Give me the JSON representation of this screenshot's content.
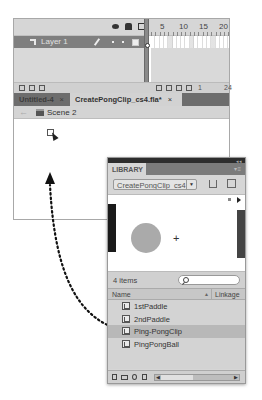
{
  "timeline": {
    "header_icons": [
      "eye-icon",
      "lock-icon",
      "outline-icon"
    ],
    "ruler_marks": [
      "5",
      "10",
      "15",
      "20"
    ],
    "layer": {
      "name": "Layer 1"
    },
    "footer_frame": "1",
    "footer_right": "24"
  },
  "tabs": [
    {
      "label": "Untitled-4",
      "close": "×",
      "active": false
    },
    {
      "label": "CreatePongClip_cs4.fla*",
      "close": "×",
      "active": true
    }
  ],
  "edit_bar": {
    "back": "←",
    "scene": "Scene 2"
  },
  "library": {
    "title": "LIBRARY",
    "menu": "▾≡",
    "document": "CreatePongClip_cs4",
    "item_count": "4 items",
    "search_placeholder": "",
    "columns": {
      "name": "Name",
      "sort": "▲",
      "linkage": "Linkage"
    },
    "items": [
      {
        "name": "1stPaddle",
        "selected": false
      },
      {
        "name": "2ndPaddle",
        "selected": false
      },
      {
        "name": "Ping-PongClip",
        "selected": true
      },
      {
        "name": "PingPongBall",
        "selected": false
      }
    ],
    "preview": {
      "crosshair": "+"
    }
  }
}
